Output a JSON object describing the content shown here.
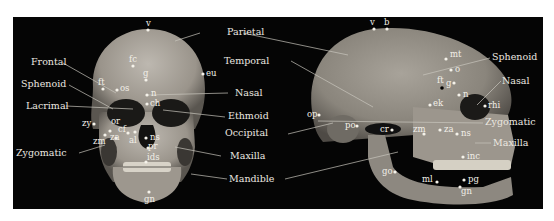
{
  "figure": {
    "background_color": "#050505",
    "label_color": "#ece8e0",
    "bone_color": "#a9a39a"
  },
  "anterior_view": {
    "bone_labels": {
      "frontal": "Frontal",
      "sphenoid": "Sphenoid",
      "lacrimal": "Lacrimal",
      "zygomatic": "Zygomatic"
    },
    "landmarks": {
      "v": "v",
      "fc": "fc",
      "ft": "ft",
      "os": "os",
      "g": "g",
      "eu": "eu",
      "n": "n",
      "ch": "ch",
      "or": "or",
      "zy": "zy",
      "cf": "cf",
      "zm": "zm",
      "za": "za",
      "al": "al",
      "ns": "ns",
      "pr": "pr",
      "ids": "ids",
      "gn": "gn"
    }
  },
  "center_labels": {
    "parietal": "Parietal",
    "temporal": "Temporal",
    "nasal": "Nasal",
    "ethmoid": "Ethmoid",
    "occipital": "Occipital",
    "maxilla": "Maxilla",
    "mandible": "Mandible"
  },
  "lateral_view": {
    "bone_labels": {
      "sphenoid": "Sphenoid",
      "nasal": "Nasal",
      "zygomatic": "Zygomatic",
      "maxilla": "Maxilla"
    },
    "landmarks": {
      "v": "v",
      "b": "b",
      "mt": "mt",
      "o": "o",
      "ft": "ft",
      "g": "g",
      "n": "n",
      "ek": "ek",
      "rhi": "rhi",
      "op": "op",
      "po": "po",
      "cr": "cr",
      "zm": "zm",
      "za": "za",
      "ns": "ns",
      "inc": "inc",
      "go": "go",
      "ml": "ml",
      "pg": "pg",
      "gn": "gn"
    }
  }
}
